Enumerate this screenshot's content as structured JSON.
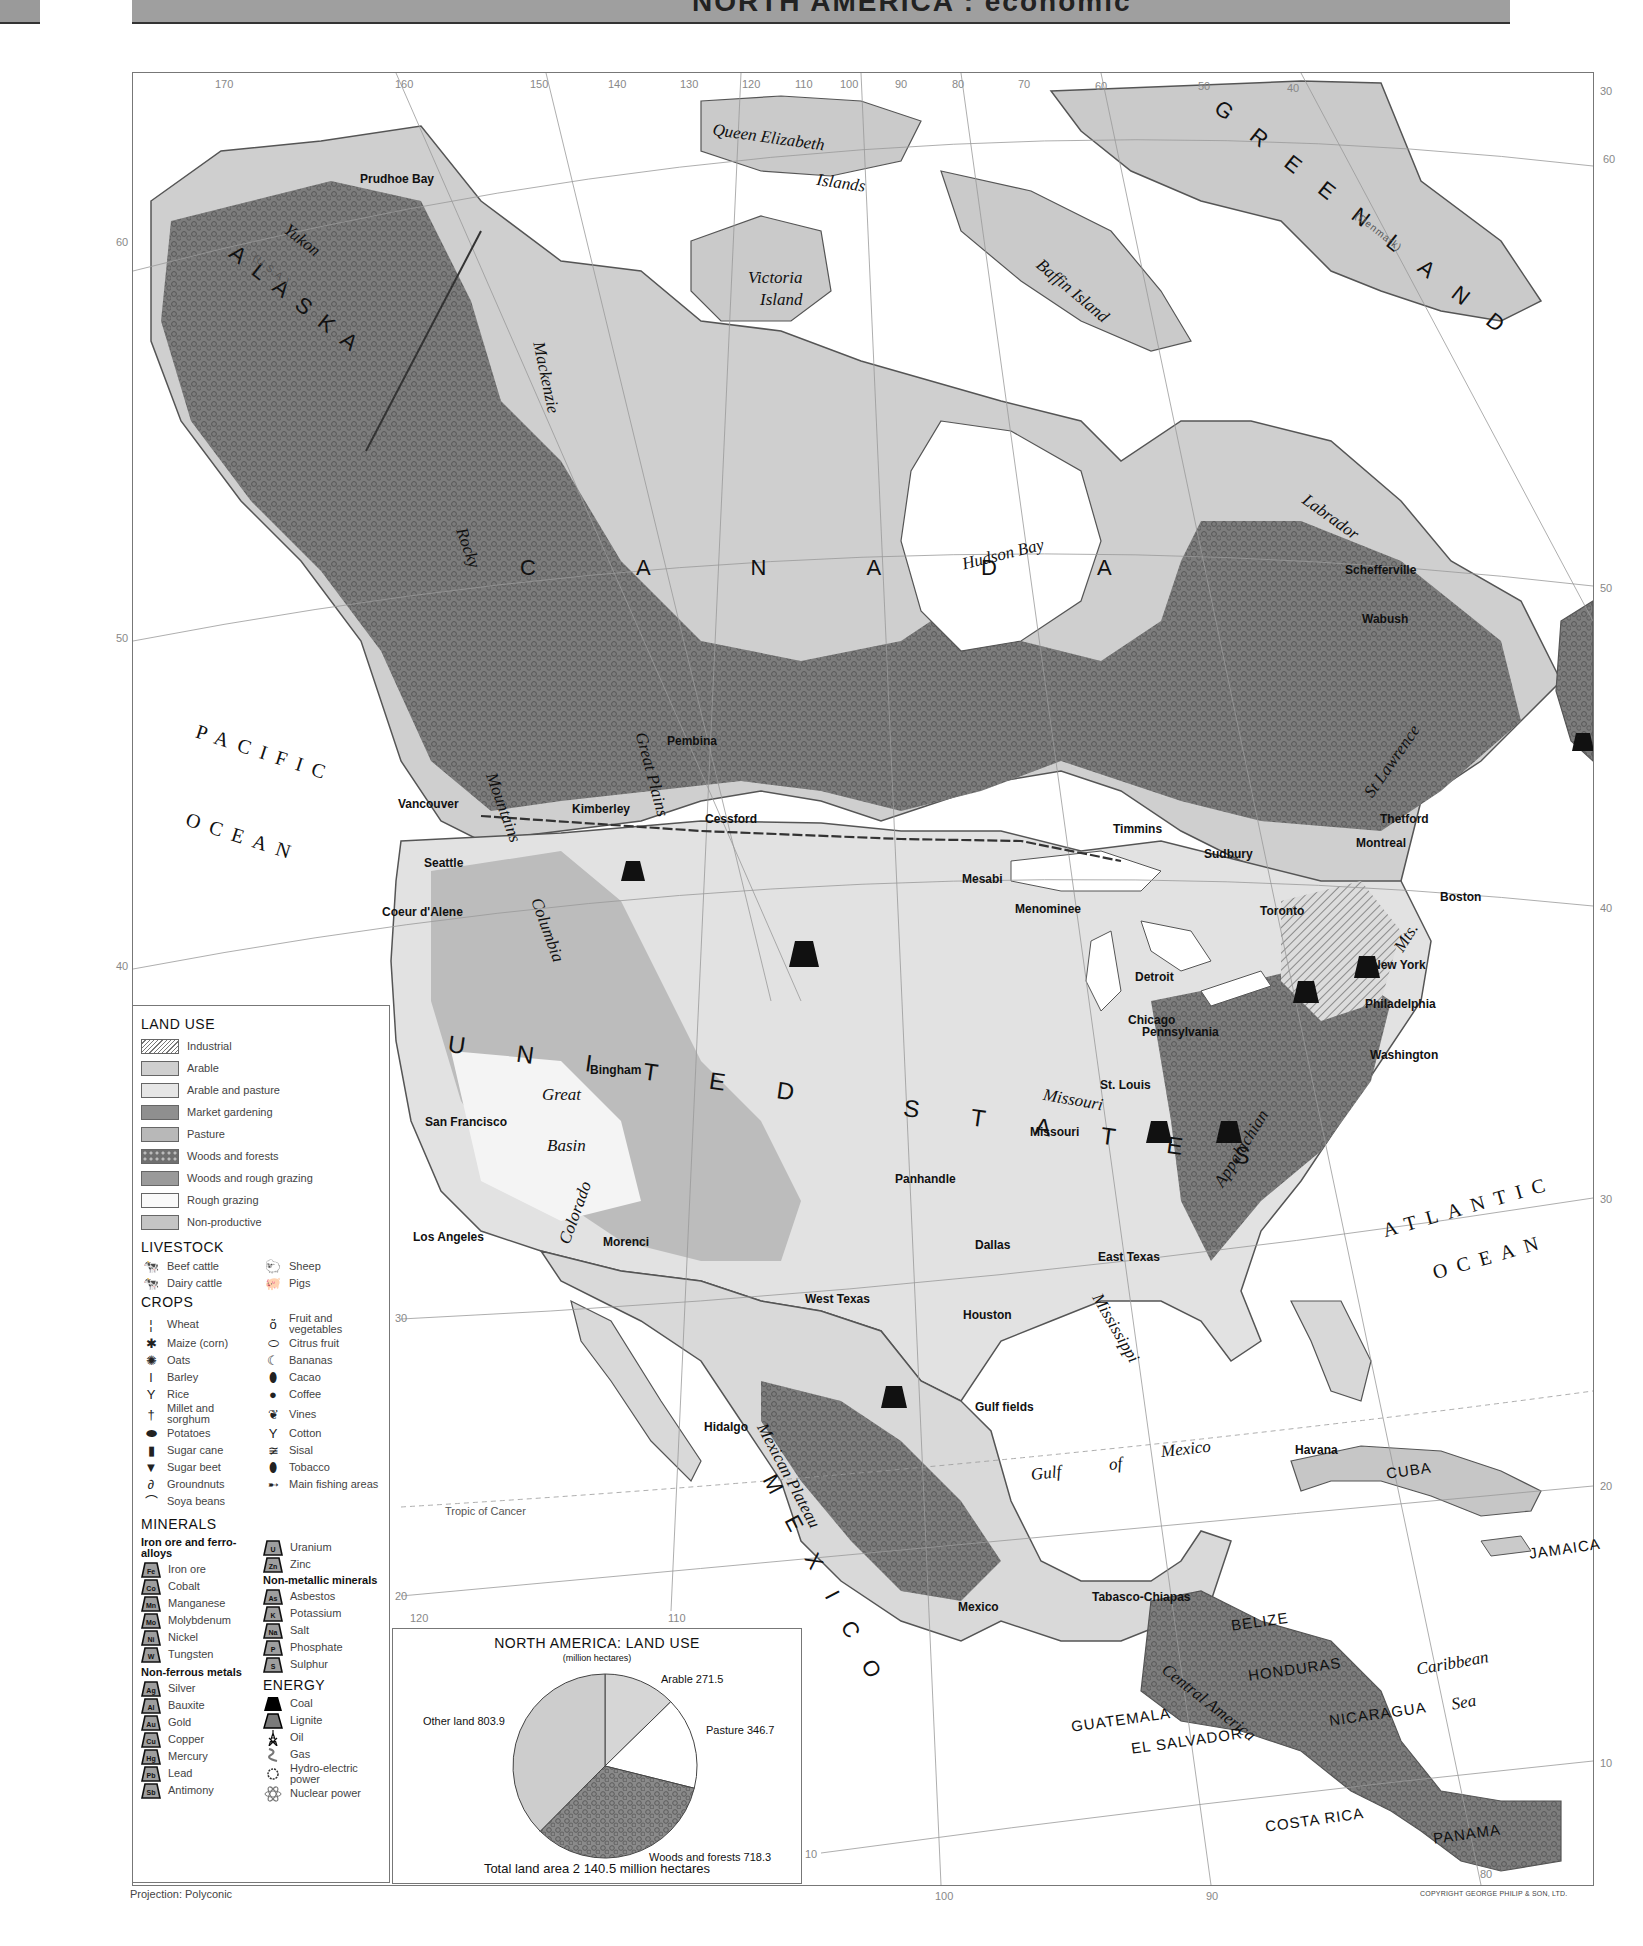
{
  "header": {
    "title": "NORTH AMERICA : economic"
  },
  "map": {
    "longitude_ticks_top": [
      {
        "label": "170",
        "x": 215,
        "y": 78
      },
      {
        "label": "160",
        "x": 395,
        "y": 78
      },
      {
        "label": "150",
        "x": 530,
        "y": 78
      },
      {
        "label": "140",
        "x": 608,
        "y": 78
      },
      {
        "label": "130",
        "x": 680,
        "y": 78
      },
      {
        "label": "120",
        "x": 742,
        "y": 78
      },
      {
        "label": "110",
        "x": 795,
        "y": 78
      },
      {
        "label": "100",
        "x": 840,
        "y": 78
      },
      {
        "label": "90",
        "x": 895,
        "y": 78
      },
      {
        "label": "80",
        "x": 952,
        "y": 78
      },
      {
        "label": "70",
        "x": 1018,
        "y": 78
      },
      {
        "label": "60",
        "x": 1095,
        "y": 80
      },
      {
        "label": "50",
        "x": 1198,
        "y": 80
      },
      {
        "label": "40",
        "x": 1287,
        "y": 82
      },
      {
        "label": "30",
        "x": 1600,
        "y": 85
      }
    ],
    "latitude_ticks": [
      {
        "label": "60",
        "x": 116,
        "y": 236
      },
      {
        "label": "50",
        "x": 116,
        "y": 632
      },
      {
        "label": "40",
        "x": 116,
        "y": 960
      },
      {
        "label": "60",
        "x": 1603,
        "y": 153
      },
      {
        "label": "50",
        "x": 1600,
        "y": 582
      },
      {
        "label": "40",
        "x": 1600,
        "y": 902
      },
      {
        "label": "30",
        "x": 1600,
        "y": 1193
      },
      {
        "label": "30",
        "x": 395,
        "y": 1312
      },
      {
        "label": "20",
        "x": 1600,
        "y": 1480
      },
      {
        "label": "20",
        "x": 395,
        "y": 1590
      },
      {
        "label": "10",
        "x": 1600,
        "y": 1757
      },
      {
        "label": "10",
        "x": 805,
        "y": 1848
      }
    ],
    "longitude_ticks_bottom": [
      {
        "label": "120",
        "x": 410,
        "y": 1612
      },
      {
        "label": "110",
        "x": 668,
        "y": 1612
      },
      {
        "label": "100",
        "x": 935,
        "y": 1890
      },
      {
        "label": "90",
        "x": 1206,
        "y": 1890
      },
      {
        "label": "80",
        "x": 1480,
        "y": 1868
      }
    ],
    "country_labels": [
      {
        "text": "ALASKA",
        "x": 240,
        "y": 240,
        "rot": 38,
        "size": 22,
        "spacing": 14
      },
      {
        "text": "(U.S.A.)",
        "x": 258,
        "y": 252,
        "rot": 38,
        "size": 10,
        "spacing": 1,
        "light": true
      },
      {
        "text": "GREENLAND",
        "x": 1225,
        "y": 95,
        "rot": 38,
        "size": 22,
        "spacing": 28
      },
      {
        "text": "(Denmark)",
        "x": 1360,
        "y": 210,
        "rot": 38,
        "size": 10,
        "spacing": 1,
        "light": true
      },
      {
        "text": "CANADA",
        "x": 520,
        "y": 555,
        "rot": 0,
        "size": 22,
        "spacing": 100
      },
      {
        "text": "UNITED STATES",
        "x": 450,
        "y": 1030,
        "rot": 8,
        "size": 24,
        "spacing": 52
      },
      {
        "text": "MEXICO",
        "x": 780,
        "y": 1470,
        "rot": 62,
        "size": 22,
        "spacing": 28
      }
    ],
    "small_country_labels": [
      {
        "text": "CUBA",
        "x": 1385,
        "y": 1465
      },
      {
        "text": "JAMAICA",
        "x": 1528,
        "y": 1545
      },
      {
        "text": "BELIZE",
        "x": 1230,
        "y": 1617
      },
      {
        "text": "HONDURAS",
        "x": 1247,
        "y": 1667
      },
      {
        "text": "NICARAGUA",
        "x": 1328,
        "y": 1712
      },
      {
        "text": "GUATEMALA",
        "x": 1070,
        "y": 1718
      },
      {
        "text": "EL SALVADOR",
        "x": 1130,
        "y": 1740
      },
      {
        "text": "COSTA RICA",
        "x": 1264,
        "y": 1818
      },
      {
        "text": "PANAMA",
        "x": 1432,
        "y": 1830
      }
    ],
    "ocean_labels": [
      {
        "text": "PACIFIC",
        "x": 200,
        "y": 720,
        "rot": 18
      },
      {
        "text": "OCEAN",
        "x": 190,
        "y": 808,
        "rot": 18
      },
      {
        "text": "ATLANTIC",
        "x": 1380,
        "y": 1220,
        "rot": -16
      },
      {
        "text": "OCEAN",
        "x": 1430,
        "y": 1262,
        "rot": -16
      }
    ],
    "region_labels": [
      {
        "text": "Queen Elizabeth",
        "x": 714,
        "y": 120,
        "rot": 8
      },
      {
        "text": "Islands",
        "x": 818,
        "y": 170,
        "rot": 8
      },
      {
        "text": "Victoria",
        "x": 748,
        "y": 268,
        "rot": 0
      },
      {
        "text": "Island",
        "x": 760,
        "y": 290,
        "rot": 0
      },
      {
        "text": "Baffin Island",
        "x": 1045,
        "y": 255,
        "rot": 40
      },
      {
        "text": "Hudson Bay",
        "x": 960,
        "y": 555,
        "rot": -14
      },
      {
        "text": "Labrador",
        "x": 1310,
        "y": 490,
        "rot": 36
      },
      {
        "text": "Yukon",
        "x": 292,
        "y": 220,
        "rot": 38
      },
      {
        "text": "Mackenzie",
        "x": 548,
        "y": 340,
        "rot": 78
      },
      {
        "text": "Rocky",
        "x": 470,
        "y": 525,
        "rot": 70
      },
      {
        "text": "Mountains",
        "x": 500,
        "y": 770,
        "rot": 70
      },
      {
        "text": "Great Plains",
        "x": 650,
        "y": 730,
        "rot": 75
      },
      {
        "text": "Columbia",
        "x": 545,
        "y": 895,
        "rot": 70
      },
      {
        "text": "Great",
        "x": 542,
        "y": 1085,
        "rot": 0
      },
      {
        "text": "Basin",
        "x": 547,
        "y": 1136,
        "rot": 0
      },
      {
        "text": "Colorado",
        "x": 555,
        "y": 1240,
        "rot": -70
      },
      {
        "text": "Missouri",
        "x": 1045,
        "y": 1085,
        "rot": 10
      },
      {
        "text": "Mississippi",
        "x": 1105,
        "y": 1290,
        "rot": 60
      },
      {
        "text": "St Lawrence",
        "x": 1360,
        "y": 790,
        "rot": -55
      },
      {
        "text": "Appalachian",
        "x": 1210,
        "y": 1180,
        "rot": -58
      },
      {
        "text": "Mts.",
        "x": 1390,
        "y": 945,
        "rot": -58
      },
      {
        "text": "Gulf",
        "x": 1030,
        "y": 1465,
        "rot": -6
      },
      {
        "text": "of",
        "x": 1108,
        "y": 1455,
        "rot": -6
      },
      {
        "text": "Mexico",
        "x": 1160,
        "y": 1442,
        "rot": -6
      },
      {
        "text": "Mexican Plateau",
        "x": 770,
        "y": 1420,
        "rot": 62
      },
      {
        "text": "Central America",
        "x": 1170,
        "y": 1660,
        "rot": 38
      },
      {
        "text": "Caribbean",
        "x": 1415,
        "y": 1660,
        "rot": -10
      },
      {
        "text": "Sea",
        "x": 1450,
        "y": 1695,
        "rot": -10
      },
      {
        "text": "Tropic of Cancer",
        "x": 445,
        "y": 1505,
        "rot": 0,
        "small": true
      }
    ],
    "place_labels": [
      {
        "text": "Prudhoe Bay",
        "x": 360,
        "y": 172
      },
      {
        "text": "Pembina",
        "x": 667,
        "y": 734
      },
      {
        "text": "Vancouver",
        "x": 398,
        "y": 797
      },
      {
        "text": "Kimberley",
        "x": 572,
        "y": 802
      },
      {
        "text": "Cessford",
        "x": 705,
        "y": 812
      },
      {
        "text": "Seattle",
        "x": 424,
        "y": 856
      },
      {
        "text": "Coeur d'Alene",
        "x": 382,
        "y": 905
      },
      {
        "text": "Timmins",
        "x": 1113,
        "y": 822
      },
      {
        "text": "Sudbury",
        "x": 1204,
        "y": 847
      },
      {
        "text": "Thetford",
        "x": 1380,
        "y": 812
      },
      {
        "text": "Montreal",
        "x": 1356,
        "y": 836
      },
      {
        "text": "Mesabi",
        "x": 962,
        "y": 872
      },
      {
        "text": "Menominee",
        "x": 1015,
        "y": 902
      },
      {
        "text": "Toronto",
        "x": 1260,
        "y": 904
      },
      {
        "text": "Boston",
        "x": 1440,
        "y": 890
      },
      {
        "text": "Detroit",
        "x": 1135,
        "y": 970
      },
      {
        "text": "New York",
        "x": 1372,
        "y": 958
      },
      {
        "text": "Philadelphia",
        "x": 1365,
        "y": 997
      },
      {
        "text": "Chicago",
        "x": 1128,
        "y": 1013
      },
      {
        "text": "Pennsylvania",
        "x": 1142,
        "y": 1025
      },
      {
        "text": "Washington",
        "x": 1370,
        "y": 1048
      },
      {
        "text": "Bingham",
        "x": 590,
        "y": 1063
      },
      {
        "text": "St. Louis",
        "x": 1100,
        "y": 1078
      },
      {
        "text": "San Francisco",
        "x": 425,
        "y": 1115
      },
      {
        "text": "Missouri",
        "x": 1030,
        "y": 1125
      },
      {
        "text": "Panhandle",
        "x": 895,
        "y": 1172
      },
      {
        "text": "Los Angeles",
        "x": 413,
        "y": 1230
      },
      {
        "text": "Morenci",
        "x": 603,
        "y": 1235
      },
      {
        "text": "Dallas",
        "x": 975,
        "y": 1238
      },
      {
        "text": "East Texas",
        "x": 1098,
        "y": 1250
      },
      {
        "text": "West Texas",
        "x": 805,
        "y": 1292
      },
      {
        "text": "Houston",
        "x": 963,
        "y": 1308
      },
      {
        "text": "Gulf fields",
        "x": 975,
        "y": 1400
      },
      {
        "text": "Hidalgo",
        "x": 704,
        "y": 1420
      },
      {
        "text": "Havana",
        "x": 1295,
        "y": 1443
      },
      {
        "text": "Mexico",
        "x": 958,
        "y": 1600
      },
      {
        "text": "Tabasco-Chiapas",
        "x": 1092,
        "y": 1590
      },
      {
        "text": "Schefferville",
        "x": 1345,
        "y": 563
      },
      {
        "text": "Wabush",
        "x": 1362,
        "y": 612
      }
    ]
  },
  "legend": {
    "land_use": {
      "title": "LAND USE",
      "items": [
        {
          "label": "Industrial",
          "pattern": "hatch"
        },
        {
          "label": "Arable",
          "color": "#cfcfcf"
        },
        {
          "label": "Arable and pasture",
          "color": "#e6e6e6"
        },
        {
          "label": "Market gardening",
          "color": "#8f8f8f"
        },
        {
          "label": "Pasture",
          "color": "#b8b8b8"
        },
        {
          "label": "Woods and forests",
          "pattern": "forest"
        },
        {
          "label": "Woods and rough grazing",
          "color": "#9a9a9a"
        },
        {
          "label": "Rough grazing",
          "color": "#fafafa"
        },
        {
          "label": "Non-productive",
          "color": "#c4c4c4"
        }
      ]
    },
    "livestock": {
      "title": "LIVESTOCK",
      "items": [
        {
          "label": "Beef cattle",
          "icon": "beef-cattle-icon",
          "glyph": "🐄"
        },
        {
          "label": "Sheep",
          "icon": "sheep-icon",
          "glyph": "🐑"
        },
        {
          "label": "Dairy cattle",
          "icon": "dairy-cattle-icon",
          "glyph": "🐄"
        },
        {
          "label": "Pigs",
          "icon": "pig-icon",
          "glyph": "🐖"
        }
      ]
    },
    "crops": {
      "title": "CROPS",
      "items": [
        {
          "label": "Wheat",
          "icon": "wheat-icon",
          "glyph": "¦"
        },
        {
          "label": "Fruit and vegetables",
          "icon": "fruit-icon",
          "glyph": "ὅ"
        },
        {
          "label": "Maize (corn)",
          "icon": "maize-icon",
          "glyph": "✱"
        },
        {
          "label": "Citrus fruit",
          "icon": "citrus-icon",
          "glyph": "⬭"
        },
        {
          "label": "Oats",
          "icon": "oats-icon",
          "glyph": "✺"
        },
        {
          "label": "Bananas",
          "icon": "banana-icon",
          "glyph": "☾"
        },
        {
          "label": "Barley",
          "icon": "barley-icon",
          "glyph": "ǀ"
        },
        {
          "label": "Cacao",
          "icon": "cacao-icon",
          "glyph": "⬮"
        },
        {
          "label": "Rice",
          "icon": "rice-icon",
          "glyph": "Y"
        },
        {
          "label": "Coffee",
          "icon": "coffee-icon",
          "glyph": "●"
        },
        {
          "label": "Millet and sorghum",
          "icon": "millet-icon",
          "glyph": "†"
        },
        {
          "label": "Vines",
          "icon": "vines-icon",
          "glyph": "❦"
        },
        {
          "label": "Potatoes",
          "icon": "potato-icon",
          "glyph": "⬬"
        },
        {
          "label": "Cotton",
          "icon": "cotton-icon",
          "glyph": "Y"
        },
        {
          "label": "Sugar cane",
          "icon": "sugar-cane-icon",
          "glyph": "▮"
        },
        {
          "label": "Sisal",
          "icon": "sisal-icon",
          "glyph": "≆"
        },
        {
          "label": "Sugar beet",
          "icon": "sugar-beet-icon",
          "glyph": "▼"
        },
        {
          "label": "Tobacco",
          "icon": "tobacco-icon",
          "glyph": "⬮"
        },
        {
          "label": "Groundnuts",
          "icon": "groundnut-icon",
          "glyph": "∂"
        },
        {
          "label": "Main fishing areas",
          "icon": "fish-icon",
          "glyph": "➸"
        },
        {
          "label": "Soya beans",
          "icon": "soya-icon",
          "glyph": "⌒"
        }
      ]
    },
    "minerals": {
      "title": "MINERALS",
      "iron_heading": "Iron ore and ferro-alloys",
      "iron": [
        {
          "symbol": "Fe",
          "label": "Iron ore"
        },
        {
          "symbol": "Co",
          "label": "Cobalt"
        },
        {
          "symbol": "Mn",
          "label": "Manganese"
        },
        {
          "symbol": "Mo",
          "label": "Molybdenum"
        },
        {
          "symbol": "Ni",
          "label": "Nickel"
        },
        {
          "symbol": "W",
          "label": "Tungsten"
        }
      ],
      "nonferrous_heading": "Non-ferrous metals",
      "nonferrous": [
        {
          "symbol": "Ag",
          "label": "Silver"
        },
        {
          "symbol": "Al",
          "label": "Bauxite"
        },
        {
          "symbol": "Au",
          "label": "Gold"
        },
        {
          "symbol": "Cu",
          "label": "Copper"
        },
        {
          "symbol": "Hg",
          "label": "Mercury"
        },
        {
          "symbol": "Pb",
          "label": "Lead"
        },
        {
          "symbol": "Sb",
          "label": "Antimony"
        }
      ],
      "other_metals": [
        {
          "symbol": "U",
          "label": "Uranium"
        },
        {
          "symbol": "Zn",
          "label": "Zinc"
        }
      ],
      "nonmetallic_heading": "Non-metallic minerals",
      "nonmetallic": [
        {
          "symbol": "As",
          "label": "Asbestos"
        },
        {
          "symbol": "K",
          "label": "Potassium"
        },
        {
          "symbol": "Na",
          "label": "Salt"
        },
        {
          "symbol": "P",
          "label": "Phosphate"
        },
        {
          "symbol": "S",
          "label": "Sulphur"
        }
      ]
    },
    "energy": {
      "title": "ENERGY",
      "items": [
        {
          "label": "Coal",
          "icon": "coal-icon"
        },
        {
          "label": "Lignite",
          "icon": "lignite-icon"
        },
        {
          "label": "Oil",
          "icon": "oil-derrick-icon"
        },
        {
          "label": "Gas",
          "icon": "gas-icon"
        },
        {
          "label": "Hydro-electric power",
          "icon": "hydro-icon"
        },
        {
          "label": "Nuclear power",
          "icon": "nuclear-icon"
        }
      ]
    }
  },
  "chart_data": {
    "type": "pie",
    "title": "NORTH AMERICA: LAND USE",
    "subtitle": "(million hectares)",
    "categories": [
      "Arable",
      "Pasture",
      "Woods and forests",
      "Other land"
    ],
    "values": [
      271.5,
      346.7,
      718.3,
      803.9
    ],
    "labels": [
      "Arable 271.5",
      "Pasture 346.7",
      "Woods and forests 718.3",
      "Other land 803.9"
    ],
    "total_text": "Total land area  2 140.5 million hectares",
    "total": 2140.5,
    "unit": "million hectares",
    "colors": [
      "#d6d6d6",
      "#ffffff",
      "#8a8a8a",
      "#cdcdcd"
    ]
  },
  "footer": {
    "projection": "Projection: Polyconic",
    "copyright": "COPYRIGHT GEORGE PHILIP & SON, LTD."
  }
}
